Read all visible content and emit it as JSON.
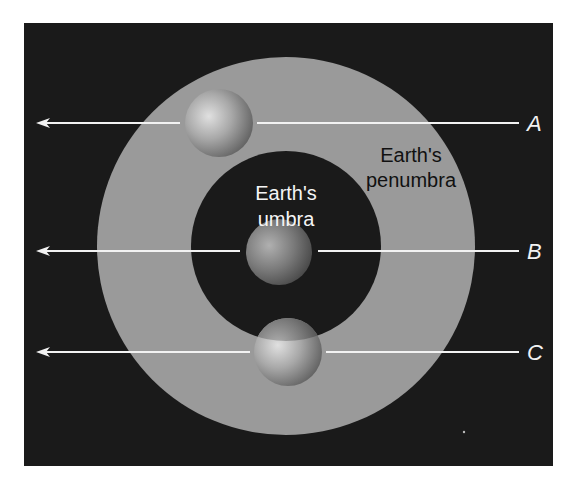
{
  "figure": {
    "colors": {
      "background": "#ffffff",
      "space": "#1a1a1a",
      "penumbra": "#9a9a9a",
      "umbra": "#1a1a1a",
      "moon_light": "#d8d8d8",
      "moon_dark": "#5a5a5a",
      "line": "#f2f2f2",
      "umbra_text": "#f5f5f5",
      "penumbra_text": "#111111",
      "path_label": "#f2f2f2"
    },
    "labels": {
      "umbra_line1": "Earth's",
      "umbra_line2": "umbra",
      "penumbra_line1": "Earth's",
      "penumbra_line2": "penumbra"
    },
    "paths": [
      {
        "label": "A",
        "y": 123,
        "moon_cx": 219,
        "moon_cy": 123
      },
      {
        "label": "B",
        "y": 251,
        "moon_cx": 280,
        "moon_cy": 252
      },
      {
        "label": "C",
        "y": 352,
        "moon_cx": 288,
        "moon_cy": 352
      }
    ]
  }
}
